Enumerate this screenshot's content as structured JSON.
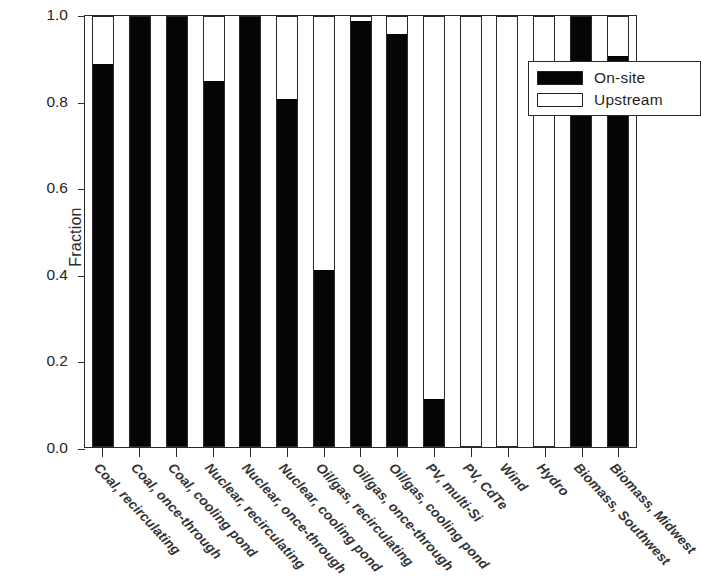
{
  "chart_data": {
    "type": "bar",
    "title": "",
    "subtitle": "",
    "xlabel": "",
    "ylabel": "Fraction",
    "ylim": [
      0.0,
      1.0
    ],
    "yticks": [
      "0.0",
      "0.2",
      "0.4",
      "0.6",
      "0.8",
      "1.0"
    ],
    "ytick_values": [
      0.0,
      0.2,
      0.4,
      0.6,
      0.8,
      1.0
    ],
    "grid": false,
    "stacked": true,
    "legend_position": "top-right",
    "legend": [
      "On-site",
      "Upstream"
    ],
    "categories": [
      "Coal, recirculating",
      "Coal, once-through",
      "Coal, cooling pond",
      "Nuclear, recirculating",
      "Nuclear, once-through",
      "Nuclear, cooling pond",
      "Oil/gas, recirculating",
      "Oil/gas, once-through",
      "Oil/gas, cooling pond",
      "PV, multi-Si",
      "PV, CdTe",
      "Wind",
      "Hydro",
      "Biomass, Southwest",
      "Biomass, Midwest"
    ],
    "series": [
      {
        "name": "On-site",
        "color": "#050505",
        "values": [
          0.89,
          1.0,
          1.0,
          0.85,
          1.0,
          0.81,
          0.41,
          0.99,
          0.96,
          0.11,
          0.0,
          0.0,
          0.0,
          1.0,
          0.91
        ]
      },
      {
        "name": "Upstream",
        "color": "#ffffff",
        "values": [
          0.11,
          0.0,
          0.0,
          0.15,
          0.0,
          0.19,
          0.59,
          0.01,
          0.04,
          0.89,
          1.0,
          1.0,
          1.0,
          0.0,
          0.09
        ]
      }
    ]
  },
  "axis": {
    "y_title": "Fraction"
  },
  "legend_items": [
    {
      "label": "On-site",
      "swatch": "black"
    },
    {
      "label": "Upstream",
      "swatch": "white"
    }
  ]
}
